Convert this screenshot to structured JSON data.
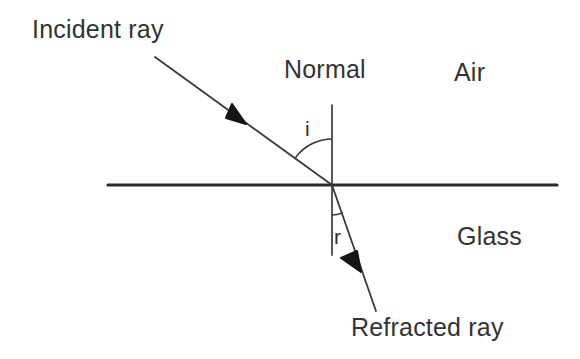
{
  "diagram": {
    "colors": {
      "line": "#2a2a2a",
      "text": "#333333",
      "background": "#ffffff"
    },
    "labels": {
      "incident_ray": "Incident ray",
      "normal": "Normal",
      "air": "Air",
      "glass": "Glass",
      "refracted_ray": "Refracted ray",
      "angle_of_incidence": "i",
      "angle_of_refraction": "r"
    },
    "geometry": {
      "boundary_line": {
        "x1": 108,
        "y1": 185,
        "x2": 557,
        "y2": 185
      },
      "normal_line": {
        "x1": 332,
        "y1": 105,
        "x2": 332,
        "y2": 255
      },
      "incident_ray": {
        "x1": 155,
        "y1": 57,
        "x2": 332,
        "y2": 185,
        "arrow_x": 238,
        "arrow_y": 118
      },
      "refracted_ray": {
        "x1": 332,
        "y1": 185,
        "x2": 376,
        "y2": 311,
        "arrow_x": 354,
        "arrow_y": 262
      },
      "incidence_point": {
        "x": 332,
        "y": 185
      },
      "arc_incidence_radius": 46,
      "arc_refraction_radius": 30
    }
  }
}
